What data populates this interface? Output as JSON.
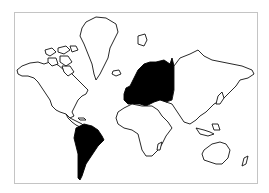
{
  "map": {
    "type": "world-outline-mercator",
    "frame_color": "#c4c4c4",
    "outline_color": "#111111",
    "land_fill": "#ffffff",
    "highlight_fill": "#000000",
    "highlighted_regions": [
      "Europe",
      "South America"
    ],
    "outlined_regions": [
      "North America",
      "Greenland",
      "Africa",
      "Asia",
      "Australia",
      "New Zealand",
      "Iceland",
      "Svalbard",
      "Arctic Islands",
      "Japan",
      "Indonesia",
      "Madagascar",
      "Caribbean"
    ]
  }
}
